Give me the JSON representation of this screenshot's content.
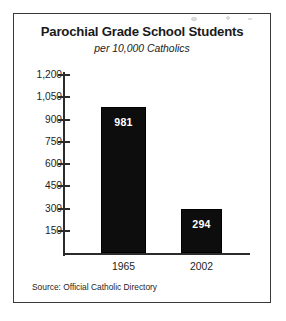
{
  "figure": {
    "source_note": "Source: Official Catholic Directory"
  },
  "chart_data": {
    "type": "bar",
    "title": "Parochial Grade School Students",
    "subtitle": "per 10,000 Catholics",
    "xlabel": "",
    "ylabel": "",
    "categories": [
      "1965",
      "2002"
    ],
    "values": [
      981,
      294
    ],
    "value_labels": [
      "981",
      "294"
    ],
    "series": [
      {
        "name": "Parochial grade school students per 10,000 Catholics",
        "values": [
          981,
          294
        ]
      }
    ],
    "ylim": [
      0,
      1200
    ],
    "yticks": [
      1200,
      1050,
      900,
      750,
      600,
      450,
      300,
      150
    ],
    "ytick_labels": [
      "1,200",
      "1,050",
      "900",
      "750",
      "600",
      "450",
      "300",
      "150"
    ],
    "grid": false,
    "legend": "none",
    "bar_color": "#0d0d0d",
    "value_label_color": "#ffffff",
    "axis_color": "#2b2b2b",
    "text_color": "#1d1d1d",
    "source": "Official Catholic Directory"
  }
}
